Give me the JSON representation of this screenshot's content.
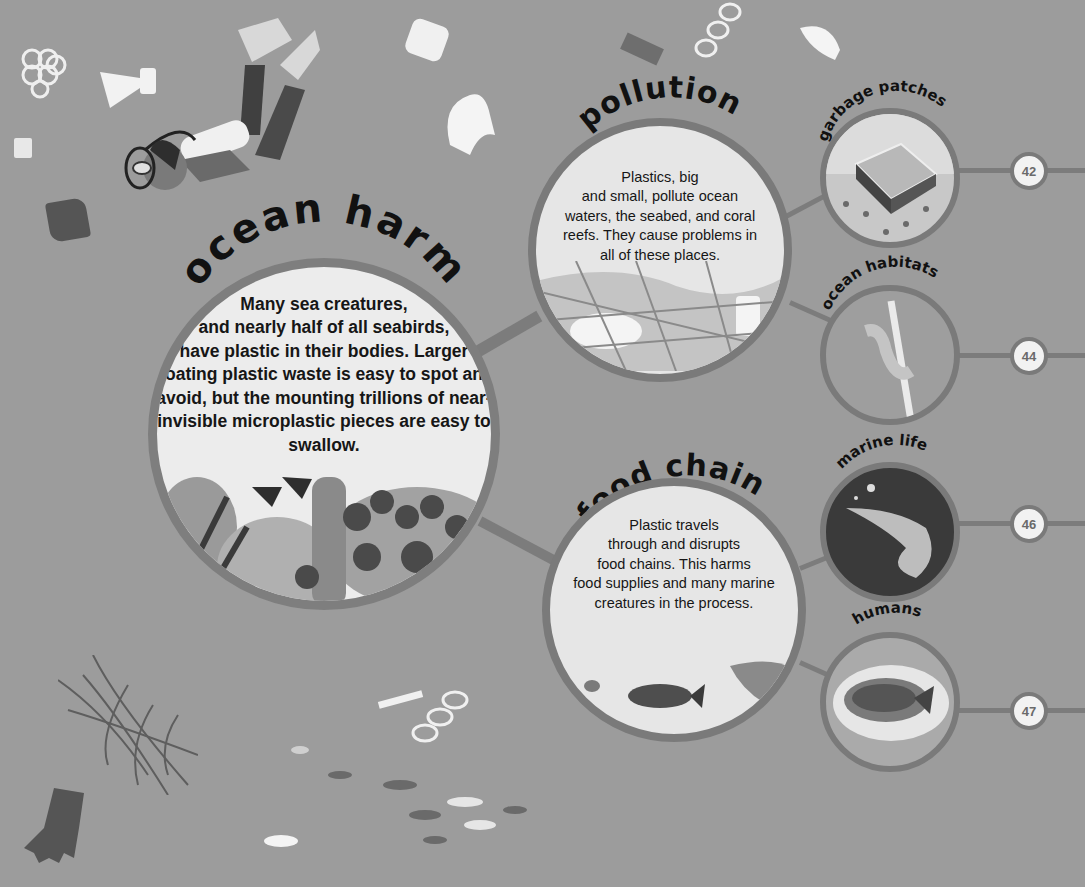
{
  "main": {
    "title": "ocean harm",
    "body_lines": [
      "Many sea creatures,",
      "and nearly half of all seabirds,",
      "have plastic in their bodies. Larger",
      "floating plastic waste is easy to spot and",
      "avoid, but the mounting trillions of near-",
      "invisible microplastic pieces are easy to swallow."
    ],
    "illustration": "coral-reef-with-fish-and-plastic-bottle"
  },
  "topics": [
    {
      "title": "pollution",
      "body_lines": [
        "Plastics, big",
        "and small, pollute ocean",
        "waters, the seabed, and coral",
        "reefs. They cause problems in",
        "all of these places."
      ],
      "illustration": "fishing-net-with-plastic-waste",
      "subtopics": [
        {
          "title": "garbage patches",
          "page": "42",
          "illustration": "floating-garbage-patch"
        },
        {
          "title": "ocean habitats",
          "page": "44",
          "illustration": "seahorse-on-cotton-swab"
        }
      ]
    },
    {
      "title": "food chain",
      "body_lines": [
        "Plastic travels",
        "through and disrupts",
        "food chains. This harms",
        "food supplies and many marine",
        "creatures in the process."
      ],
      "illustration": "small-fish-bigger-fish-shark",
      "subtopics": [
        {
          "title": "marine life",
          "page": "46",
          "illustration": "shrimp"
        },
        {
          "title": "humans",
          "page": "47",
          "illustration": "fish-dish-on-plate"
        }
      ]
    }
  ],
  "background": {
    "illustrations": [
      "scuba-diver",
      "six-pack-ring",
      "plastic-bottle-funnel",
      "fork",
      "cup",
      "glove",
      "bag",
      "spoons",
      "straws",
      "chain-ring",
      "clip",
      "face-mask",
      "fishing-net",
      "rubber-glove",
      "school-of-fish",
      "bottle-cap",
      "toothbrush"
    ]
  },
  "colors": {
    "background": "#9c9c9c",
    "circle_fill": "#ececec",
    "ring": "#7a7a7a",
    "text": "#161616",
    "badge_text": "#6a6a6a"
  }
}
